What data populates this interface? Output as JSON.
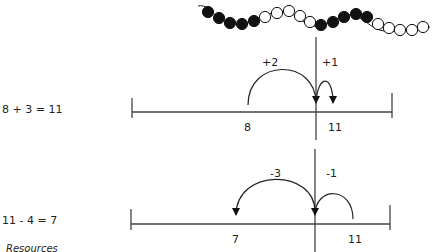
{
  "beads": {
    "pattern": [
      "black",
      "black",
      "black",
      "black",
      "black",
      "white",
      "white",
      "white",
      "white",
      "white",
      "black",
      "black",
      "black",
      "black",
      "black",
      "white",
      "white",
      "white",
      "white",
      "white"
    ],
    "colors": {
      "black": "#111111",
      "white": "#ffffff"
    }
  },
  "equation_1": {
    "text": "8 + 3 = 11",
    "jumps": [
      {
        "label": "+2"
      },
      {
        "label": "+1"
      }
    ],
    "start_label": "8",
    "end_label": "11"
  },
  "equation_2": {
    "text": "11 - 4 = 7",
    "jumps": [
      {
        "label": "-3"
      },
      {
        "label": "-1"
      }
    ],
    "start_label": "11",
    "end_label": "7"
  },
  "footer": {
    "resources_label": "Resources"
  }
}
